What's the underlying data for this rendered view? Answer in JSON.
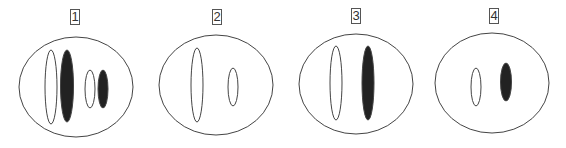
{
  "diagram": {
    "colors": {
      "stroke": "#444444",
      "fill_dark": "#222222",
      "fill_light": "#ffffff",
      "background": "#ffffff"
    },
    "cells": [
      {
        "label": "1",
        "label_pos": {
          "x": 70,
          "y": 9
        },
        "outer": {
          "cx": 76,
          "cy": 87,
          "rx": 57,
          "ry": 50
        },
        "shapes": [
          {
            "type": "hollow",
            "cx": 51,
            "cy": 87,
            "rx": 6,
            "ry": 37
          },
          {
            "type": "filled",
            "cx": 67,
            "cy": 86,
            "rx": 6.5,
            "ry": 36
          },
          {
            "type": "hollow",
            "cx": 90,
            "cy": 89,
            "rx": 5,
            "ry": 19
          },
          {
            "type": "filled",
            "cx": 103,
            "cy": 89,
            "rx": 5,
            "ry": 19
          }
        ]
      },
      {
        "label": "2",
        "label_pos": {
          "x": 212,
          "y": 9
        },
        "outer": {
          "cx": 216,
          "cy": 85,
          "rx": 57,
          "ry": 50
        },
        "shapes": [
          {
            "type": "hollow",
            "cx": 197,
            "cy": 85,
            "rx": 6,
            "ry": 37
          },
          {
            "type": "hollow",
            "cx": 233,
            "cy": 87,
            "rx": 5,
            "ry": 19
          }
        ]
      },
      {
        "label": "3",
        "label_pos": {
          "x": 351,
          "y": 8
        },
        "outer": {
          "cx": 356,
          "cy": 84,
          "rx": 57,
          "ry": 50
        },
        "shapes": [
          {
            "type": "hollow",
            "cx": 336,
            "cy": 83,
            "rx": 6,
            "ry": 37
          },
          {
            "type": "filled",
            "cx": 368,
            "cy": 83,
            "rx": 6,
            "ry": 37
          }
        ]
      },
      {
        "label": "4",
        "label_pos": {
          "x": 489,
          "y": 8
        },
        "outer": {
          "cx": 492,
          "cy": 83,
          "rx": 57,
          "ry": 50
        },
        "shapes": [
          {
            "type": "hollow",
            "cx": 476,
            "cy": 87,
            "rx": 5,
            "ry": 19
          },
          {
            "type": "filled",
            "cx": 506,
            "cy": 82,
            "rx": 5.5,
            "ry": 19
          }
        ]
      }
    ]
  }
}
